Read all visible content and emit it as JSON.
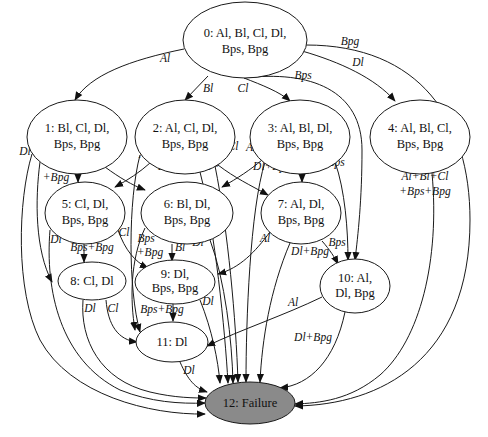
{
  "diagram": {
    "type": "state-transition-graph",
    "failure_fill": "#8a8a8a",
    "nodes": [
      {
        "id": 0,
        "label_l1": "0: Al, Bl, Cl, Dl,",
        "label_l2": "Bps, Bpg",
        "cx": 245,
        "cy": 40,
        "rx": 62,
        "ry": 38
      },
      {
        "id": 1,
        "label_l1": "1: Bl, Cl, Dl,",
        "label_l2": "Bps, Bpg",
        "cx": 77,
        "cy": 137,
        "rx": 50,
        "ry": 37
      },
      {
        "id": 2,
        "label_l1": "2: Al, Cl, Dl,",
        "label_l2": "Bps, Bpg",
        "cx": 185,
        "cy": 137,
        "rx": 50,
        "ry": 37
      },
      {
        "id": 3,
        "label_l1": "3: Al, Bl, Dl,",
        "label_l2": "Bps, Bpg",
        "cx": 300,
        "cy": 137,
        "rx": 50,
        "ry": 37
      },
      {
        "id": 4,
        "label_l1": "4: Al, Bl, Cl,",
        "label_l2": "Bps, Bpg",
        "cx": 420,
        "cy": 137,
        "rx": 50,
        "ry": 37
      },
      {
        "id": 5,
        "label_l1": "5: Cl, Dl,",
        "label_l2": "Bps, Bpg",
        "cx": 85,
        "cy": 213,
        "rx": 40,
        "ry": 31
      },
      {
        "id": 6,
        "label_l1": "6: Bl, Dl,",
        "label_l2": "Bps, Bpg",
        "cx": 187,
        "cy": 213,
        "rx": 46,
        "ry": 31
      },
      {
        "id": 7,
        "label_l1": "7: Al, Dl,",
        "label_l2": "Bps, Bpg",
        "cx": 301,
        "cy": 213,
        "rx": 40,
        "ry": 31
      },
      {
        "id": 8,
        "label_l1": "8: Cl, Dl",
        "label_l2": "",
        "cx": 83,
        "cy": 281,
        "rx": 34,
        "ry": 19
      },
      {
        "id": 9,
        "label_l1": "9: Dl,",
        "label_l2": "Bps, Bpg",
        "cx": 180,
        "cy": 282,
        "rx": 39,
        "ry": 21
      },
      {
        "id": 10,
        "label_l1": "10: Al,",
        "label_l2": "Dl, Bpg",
        "cx": 355,
        "cy": 286,
        "rx": 35,
        "ry": 26
      },
      {
        "id": 11,
        "label_l1": "11: Dl",
        "label_l2": "",
        "cx": 172,
        "cy": 342,
        "rx": 35,
        "ry": 20
      },
      {
        "id": 12,
        "label_l1": "12: Failure",
        "label_l2": "",
        "cx": 250,
        "cy": 403,
        "rx": 45,
        "ry": 21,
        "failure": true
      }
    ],
    "edges": [
      {
        "from": 0,
        "to": 1,
        "label": "Al",
        "lx": 165,
        "ly": 62
      },
      {
        "from": 0,
        "to": 2,
        "label": "Bl",
        "lx": 208,
        "ly": 92
      },
      {
        "from": 0,
        "to": 3,
        "label": "Cl",
        "lx": 243,
        "ly": 92
      },
      {
        "from": 0,
        "to": 4,
        "label": "Dl",
        "lx": 358,
        "ly": 66
      },
      {
        "from": 0,
        "to": 10,
        "label": "Bps",
        "lx": 303,
        "ly": 78
      },
      {
        "from": 0,
        "to": 12,
        "label": "Bpg",
        "lx": 350,
        "ly": 46
      },
      {
        "from": 1,
        "to": 5,
        "label": "Bl",
        "lx": 82,
        "ly": 169
      },
      {
        "from": 1,
        "to": 6,
        "label": "Cl",
        "lx": 102,
        "ly": 165
      },
      {
        "from": 1,
        "to": 8,
        "label": "Bps +Bpg",
        "lx": 53,
        "ly": 170
      },
      {
        "from": 1,
        "to": 12,
        "label": "Dl",
        "lx": 24,
        "ly": 154
      },
      {
        "from": 2,
        "to": 5,
        "label": "Al",
        "lx": 144,
        "ly": 158
      },
      {
        "from": 2,
        "to": 7,
        "label": "Cl",
        "lx": 233,
        "ly": 149
      },
      {
        "from": 2,
        "to": 11,
        "label": "Dl+Bpg",
        "lx": 177,
        "ly": 170
      },
      {
        "from": 2,
        "to": 12,
        "label": "Bps",
        "lx": 209,
        "ly": 167
      },
      {
        "from": 3,
        "to": 6,
        "label": "Al",
        "lx": 251,
        "ly": 150
      },
      {
        "from": 3,
        "to": 7,
        "label": "Bl",
        "lx": 305,
        "ly": 172
      },
      {
        "from": 3,
        "to": 10,
        "label": "Bps",
        "lx": 336,
        "ly": 165
      },
      {
        "from": 3,
        "to": 12,
        "label": "Dl+Bpg",
        "lx": 270,
        "ly": 170
      },
      {
        "from": 4,
        "to": 12,
        "label": "Al+Bl+Cl +Bps+Bpg",
        "lx": 422,
        "ly": 178
      },
      {
        "from": 5,
        "to": 8,
        "label": "Bps+Bpg",
        "lx": 88,
        "ly": 250
      },
      {
        "from": 5,
        "to": 9,
        "label": "Cl",
        "lx": 124,
        "ly": 236
      },
      {
        "from": 5,
        "to": 12,
        "label": "Dl",
        "lx": 55,
        "ly": 243
      },
      {
        "from": 6,
        "to": 9,
        "label": "Bl",
        "lx": 180,
        "ly": 251
      },
      {
        "from": 6,
        "to": 11,
        "label": "Bps +Bpg",
        "lx": 147,
        "ly": 246
      },
      {
        "from": 6,
        "to": 12,
        "label": "Dl",
        "lx": 198,
        "ly": 245
      },
      {
        "from": 7,
        "to": 9,
        "label": "Al",
        "lx": 265,
        "ly": 242
      },
      {
        "from": 7,
        "to": 10,
        "label": "Bps",
        "lx": 337,
        "ly": 246
      },
      {
        "from": 7,
        "to": 12,
        "label": "Dl+Bpg",
        "lx": 310,
        "ly": 254
      },
      {
        "from": 8,
        "to": 11,
        "label": "Cl",
        "lx": 113,
        "ly": 312
      },
      {
        "from": 8,
        "to": 12,
        "label": "Dl",
        "lx": 88,
        "ly": 312
      },
      {
        "from": 9,
        "to": 11,
        "label": "Bps+Bpg",
        "lx": 162,
        "ly": 313
      },
      {
        "from": 9,
        "to": 12,
        "label": "Dl",
        "lx": 208,
        "ly": 304
      },
      {
        "from": 10,
        "to": 11,
        "label": "Al",
        "lx": 293,
        "ly": 306
      },
      {
        "from": 10,
        "to": 12,
        "label": "Dl+Bpg",
        "lx": 312,
        "ly": 340
      },
      {
        "from": 11,
        "to": 12,
        "label": "Dl",
        "lx": 189,
        "ly": 373
      }
    ]
  }
}
